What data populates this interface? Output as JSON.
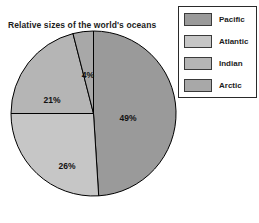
{
  "chart_data": {
    "type": "pie",
    "title": "Relative sizes of the world's oceans",
    "categories": [
      "Pacific",
      "Atlantic",
      "Indian",
      "Arctic"
    ],
    "values": [
      49,
      26,
      21,
      4
    ],
    "value_labels": [
      "49%",
      "26%",
      "21%",
      "4%"
    ],
    "units": "percent",
    "start_angle_deg": 0,
    "direction": "clockwise",
    "legend_position": "right",
    "legend_entries": [
      {
        "label": "Pacific",
        "value": 49,
        "value_label": "49%",
        "color": "#9a9a9a"
      },
      {
        "label": "Atlantic",
        "value": 26,
        "value_label": "26%",
        "color": "#c6c6c6"
      },
      {
        "label": "Indian",
        "value": 21,
        "value_label": "21%",
        "color": "#b5b5b5"
      },
      {
        "label": "Arctic",
        "value": 4,
        "value_label": "4%",
        "color": "#a8a8a8"
      }
    ],
    "slice_colors": [
      "#9a9a9a",
      "#c6c6c6",
      "#b5b5b5",
      "#a8a8a8"
    ],
    "outline_color": "#000000",
    "grid": false,
    "xlabel": "",
    "ylabel": ""
  },
  "slice_label_positions": {
    "pacific": {
      "x": 118,
      "y": 91
    },
    "atlantic": {
      "x": 57,
      "y": 139
    },
    "indian": {
      "x": 42,
      "y": 73
    },
    "arctic": {
      "x": 78,
      "y": 48
    }
  }
}
